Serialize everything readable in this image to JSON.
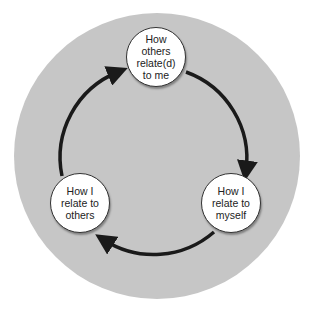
{
  "diagram": {
    "type": "cycle",
    "background_color": "#c6c6c6",
    "arrow_color": "#1a1a1a",
    "nodes": [
      {
        "id": "top",
        "label": "How\nothers\nrelate(d)\nto me"
      },
      {
        "id": "right",
        "label": "How I\nrelate to\nmyself"
      },
      {
        "id": "left",
        "label": "How I\nrelate to\nothers"
      }
    ],
    "edges": [
      {
        "from": "top",
        "to": "right"
      },
      {
        "from": "right",
        "to": "left"
      },
      {
        "from": "left",
        "to": "top"
      }
    ]
  }
}
